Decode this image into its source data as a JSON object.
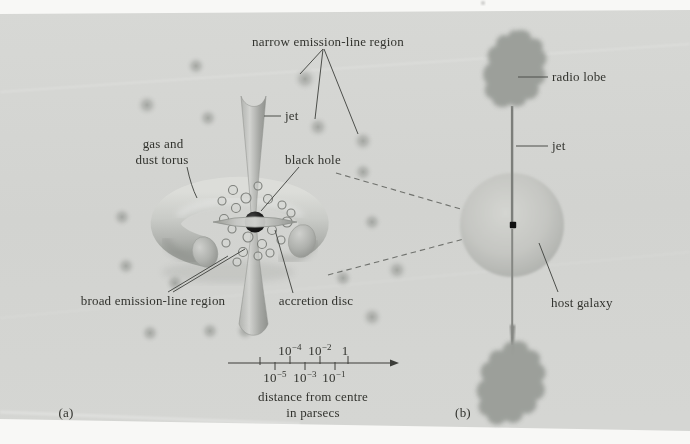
{
  "figure": {
    "panel_a": {
      "tag": "(a)",
      "labels": {
        "narrow_region": "narrow emission-line region",
        "jet": "jet",
        "torus_line1": "gas and",
        "torus_line2": "dust torus",
        "black_hole": "black hole",
        "broad_region": "broad emission-line region",
        "accretion_disc": "accretion disc"
      },
      "scale_bar": {
        "upper_labels": [
          {
            "base": "10",
            "exp": "−4"
          },
          {
            "base": "10",
            "exp": "−2"
          },
          {
            "base": "1",
            "exp": ""
          }
        ],
        "lower_labels": [
          {
            "base": "10",
            "exp": "−5"
          },
          {
            "base": "10",
            "exp": "−3"
          },
          {
            "base": "10",
            "exp": "−1"
          }
        ],
        "caption_line1": "distance from centre",
        "caption_line2": "in parsecs"
      }
    },
    "panel_b": {
      "tag": "(b)",
      "labels": {
        "radio_lobe": "radio lobe",
        "jet": "jet",
        "host_galaxy": "host galaxy"
      }
    },
    "colors": {
      "page_white": "#f7f7f5",
      "panel_gray": "#d3d4d1",
      "ink": "#32332e",
      "lobe_gray": "#999c97",
      "black_hole": "#161616"
    }
  }
}
